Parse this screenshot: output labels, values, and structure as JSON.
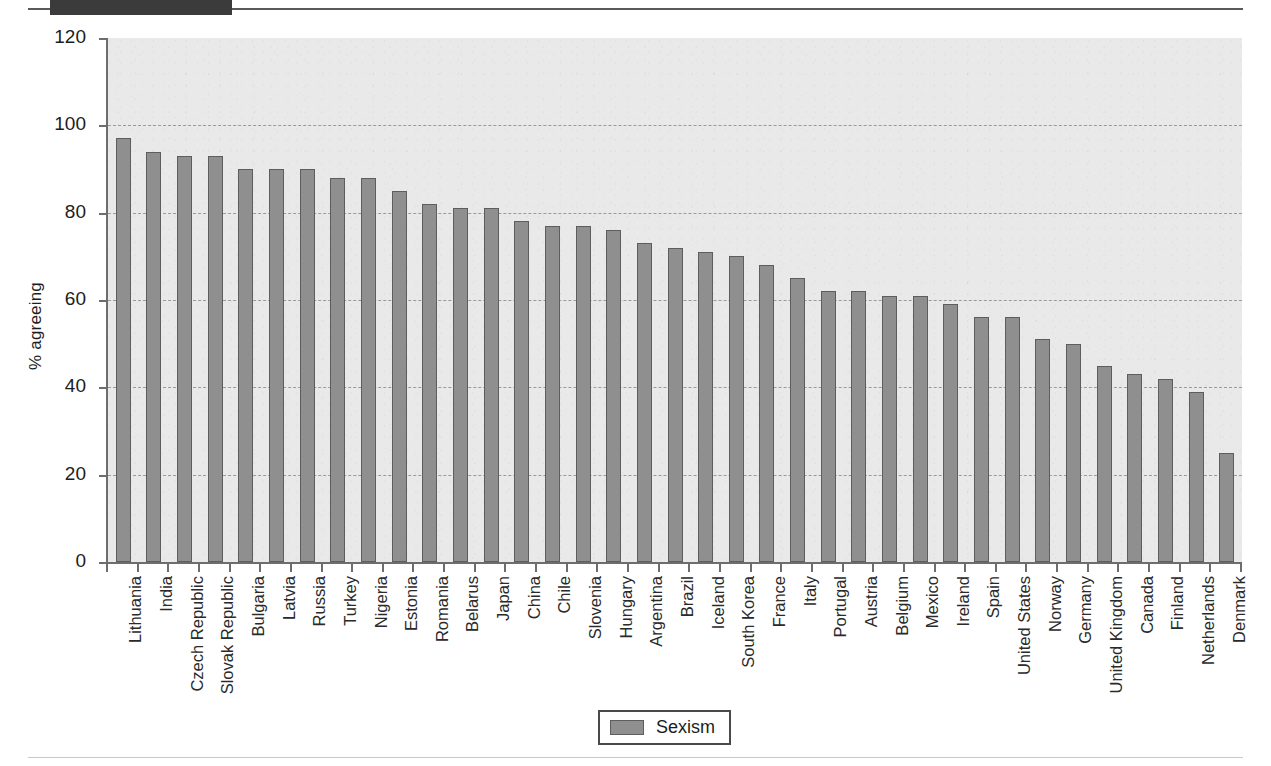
{
  "page": {
    "top_rule": "horizontal-rule",
    "redaction": "redacted-block",
    "bottom_rule": "horizontal-rule"
  },
  "legend": {
    "entries": [
      {
        "label": "Sexism",
        "color": "#8f8f8f"
      }
    ]
  },
  "chart_data": {
    "type": "bar",
    "title": "",
    "subtitle": "",
    "xlabel": "",
    "ylabel": "% agreeing",
    "ylim": [
      0,
      120
    ],
    "yticks": [
      0,
      20,
      40,
      60,
      80,
      100,
      120
    ],
    "ytick_labels": [
      "0",
      "20",
      "40",
      "60",
      "80",
      "100",
      "120"
    ],
    "grid": true,
    "grid_axis": "y",
    "grid_style": "dashed",
    "legend_position": "bottom-center",
    "series_name": "Sexism",
    "bar_color": "#8f8f8f",
    "bar_edge_color": "#5d5d5d",
    "plot_background": "#e9e9e9",
    "categories": [
      "Lithuania",
      "India",
      "Czech Republic",
      "Slovak Republic",
      "Bulgaria",
      "Latvia",
      "Russia",
      "Turkey",
      "Nigeria",
      "Estonia",
      "Romania",
      "Belarus",
      "Japan",
      "China",
      "Chile",
      "Slovenia",
      "Hungary",
      "Argentina",
      "Brazil",
      "Iceland",
      "South Korea",
      "France",
      "Italy",
      "Portugal",
      "Austria",
      "Belgium",
      "Mexico",
      "Ireland",
      "Spain",
      "United States",
      "Norway",
      "Germany",
      "United Kingdom",
      "Canada",
      "Finland",
      "Netherlands",
      "Denmark"
    ],
    "values": [
      97,
      94,
      93,
      93,
      90,
      90,
      90,
      88,
      88,
      85,
      82,
      81,
      81,
      78,
      77,
      77,
      76,
      73,
      72,
      71,
      70,
      68,
      65,
      62,
      62,
      61,
      61,
      59,
      56,
      56,
      51,
      50,
      45,
      43,
      42,
      39,
      25
    ],
    "series": [
      {
        "name": "Sexism",
        "values": [
          97,
          94,
          93,
          93,
          90,
          90,
          90,
          88,
          88,
          85,
          82,
          81,
          81,
          78,
          77,
          77,
          76,
          73,
          72,
          71,
          70,
          68,
          65,
          62,
          62,
          61,
          61,
          59,
          56,
          56,
          51,
          50,
          45,
          43,
          42,
          39,
          25
        ]
      }
    ]
  }
}
